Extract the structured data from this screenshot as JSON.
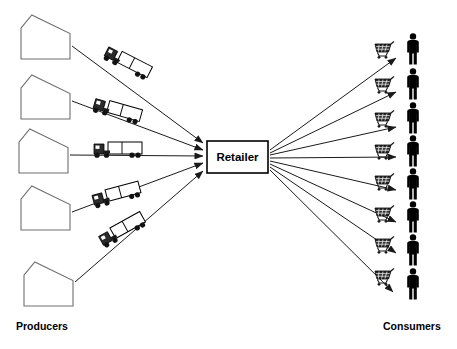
{
  "diagram": {
    "colors": {
      "background": "#ffffff",
      "line": "#1a1a1a",
      "house_stroke": "#6f6f6f",
      "node_fill": "#ffffff",
      "node_stroke": "#000000",
      "figure": "#000000"
    },
    "center_node": {
      "label": "Retailer",
      "x": 207,
      "y": 141,
      "width": 61,
      "height": 32
    },
    "left_label": "Producers",
    "right_label": "Consumers",
    "producers": [
      {
        "name": "producer-1",
        "x": 21,
        "y": 15,
        "w": 49,
        "h": 44
      },
      {
        "name": "producer-2",
        "x": 21,
        "y": 75,
        "w": 49,
        "h": 44
      },
      {
        "name": "producer-3",
        "x": 19,
        "y": 129,
        "w": 49,
        "h": 44
      },
      {
        "name": "producer-4",
        "x": 21,
        "y": 186,
        "w": 49,
        "h": 44
      },
      {
        "name": "producer-5",
        "x": 24,
        "y": 262,
        "w": 49,
        "h": 44
      }
    ],
    "trucks": [
      {
        "name": "truck-1",
        "x": 127,
        "y": 64,
        "angle": 27
      },
      {
        "name": "truck-2",
        "x": 117,
        "y": 112,
        "angle": 16
      },
      {
        "name": "truck-3",
        "x": 118,
        "y": 151,
        "angle": 0
      },
      {
        "name": "truck-4",
        "x": 117,
        "y": 196,
        "angle": -15
      },
      {
        "name": "truck-5",
        "x": 123,
        "y": 231,
        "angle": -29
      }
    ],
    "inbound_arrows": [
      {
        "name": "inbound-arrow-1",
        "x1": 72,
        "y1": 46,
        "x2": 203,
        "y2": 143
      },
      {
        "name": "inbound-arrow-2",
        "x1": 72,
        "y1": 101,
        "x2": 203,
        "y2": 150
      },
      {
        "name": "inbound-arrow-3",
        "x1": 70,
        "y1": 155,
        "x2": 203,
        "y2": 156
      },
      {
        "name": "inbound-arrow-4",
        "x1": 72,
        "y1": 212,
        "x2": 203,
        "y2": 163
      },
      {
        "name": "inbound-arrow-5",
        "x1": 75,
        "y1": 282,
        "x2": 203,
        "y2": 171
      }
    ],
    "outbound_arrows": [
      {
        "name": "outbound-arrow-1",
        "x1": 270,
        "y1": 150,
        "x2": 396,
        "y2": 58
      },
      {
        "name": "outbound-arrow-2",
        "x1": 270,
        "y1": 153,
        "x2": 396,
        "y2": 92
      },
      {
        "name": "outbound-arrow-3",
        "x1": 270,
        "y1": 155,
        "x2": 396,
        "y2": 127
      },
      {
        "name": "outbound-arrow-4",
        "x1": 270,
        "y1": 158,
        "x2": 396,
        "y2": 157
      },
      {
        "name": "outbound-arrow-5",
        "x1": 270,
        "y1": 161,
        "x2": 396,
        "y2": 190
      },
      {
        "name": "outbound-arrow-6",
        "x1": 270,
        "y1": 164,
        "x2": 396,
        "y2": 222
      },
      {
        "name": "outbound-arrow-7",
        "x1": 270,
        "y1": 167,
        "x2": 396,
        "y2": 253
      },
      {
        "name": "outbound-arrow-8",
        "x1": 270,
        "y1": 170,
        "x2": 393,
        "y2": 292
      }
    ],
    "carts": [
      {
        "name": "cart-1",
        "x": 374,
        "y": 44
      },
      {
        "name": "cart-2",
        "x": 374,
        "y": 79
      },
      {
        "name": "cart-3",
        "x": 374,
        "y": 113
      },
      {
        "name": "cart-4",
        "x": 374,
        "y": 145
      },
      {
        "name": "cart-5",
        "x": 374,
        "y": 176
      },
      {
        "name": "cart-6",
        "x": 374,
        "y": 208
      },
      {
        "name": "cart-7",
        "x": 374,
        "y": 239
      },
      {
        "name": "cart-8",
        "x": 374,
        "y": 271
      }
    ],
    "consumers": [
      {
        "name": "consumer-1",
        "x": 404,
        "y": 33
      },
      {
        "name": "consumer-2",
        "x": 404,
        "y": 68
      },
      {
        "name": "consumer-3",
        "x": 404,
        "y": 102
      },
      {
        "name": "consumer-4",
        "x": 404,
        "y": 135
      },
      {
        "name": "consumer-5",
        "x": 404,
        "y": 168
      },
      {
        "name": "consumer-6",
        "x": 404,
        "y": 201
      },
      {
        "name": "consumer-7",
        "x": 404,
        "y": 234
      },
      {
        "name": "consumer-8",
        "x": 404,
        "y": 268
      }
    ],
    "counts": {
      "producers": 5,
      "trucks": 5,
      "carts": 8,
      "consumers": 8
    }
  }
}
